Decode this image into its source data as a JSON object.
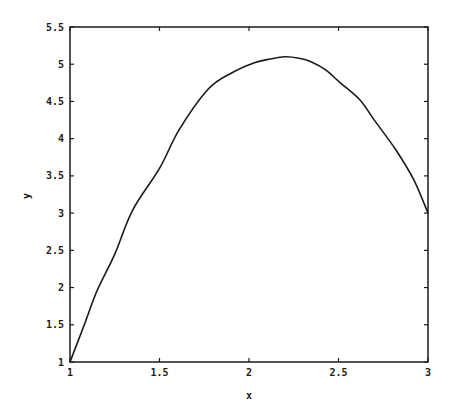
{
  "chart_data": {
    "type": "line",
    "title": "",
    "xlabel": "x",
    "ylabel": "y",
    "xlim": [
      1,
      3
    ],
    "ylim": [
      1,
      5.5
    ],
    "grid": false,
    "legend": null,
    "x_ticks": [
      "1",
      "1.5",
      "2",
      "2.5",
      "3"
    ],
    "y_ticks": [
      "1",
      "1.5",
      "2",
      "2.5",
      "3",
      "3.5",
      "4",
      "4.5",
      "5",
      "5.5"
    ],
    "series": [
      {
        "name": "y(x)",
        "color": "#1a1a1a",
        "x": [
          1.0,
          1.08,
          1.15,
          1.25,
          1.35,
          1.5,
          1.61,
          1.77,
          1.9,
          2.03,
          2.12,
          2.2,
          2.28,
          2.35,
          2.43,
          2.51,
          2.62,
          2.7,
          2.82,
          2.92,
          3.0
        ],
        "y": [
          1.0,
          1.5,
          1.95,
          2.45,
          3.04,
          3.6,
          4.12,
          4.66,
          4.88,
          5.02,
          5.07,
          5.1,
          5.08,
          5.03,
          4.92,
          4.75,
          4.52,
          4.25,
          3.85,
          3.45,
          3.0
        ]
      }
    ]
  },
  "axes": {
    "x_label": "x",
    "y_label": "y"
  }
}
